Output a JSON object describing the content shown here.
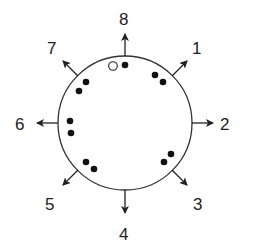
{
  "diagram": {
    "type": "circle-with-radial-arrows",
    "circle": {
      "cx": 125,
      "cy": 123,
      "r": 67,
      "stroke": "#333333"
    },
    "arrow_color": "#222222",
    "dot_color": "#111111",
    "directions": [
      {
        "label": "1",
        "angle_deg": 45
      },
      {
        "label": "2",
        "angle_deg": 0
      },
      {
        "label": "3",
        "angle_deg": -45
      },
      {
        "label": "4",
        "angle_deg": -90
      },
      {
        "label": "5",
        "angle_deg": -135
      },
      {
        "label": "6",
        "angle_deg": 180
      },
      {
        "label": "7",
        "angle_deg": 135
      },
      {
        "label": "8",
        "angle_deg": 90
      }
    ],
    "labels": {
      "d1": "1",
      "d2": "2",
      "d3": "3",
      "d4": "4",
      "d5": "5",
      "d6": "6",
      "d7": "7",
      "d8": "8"
    },
    "dots": [
      {
        "near": "8",
        "type": "open",
        "x": 113,
        "y": 66
      },
      {
        "near": "8",
        "type": "filled",
        "x": 125,
        "y": 65
      },
      {
        "near": "1",
        "type": "filled",
        "x": 155,
        "y": 75
      },
      {
        "near": "1",
        "type": "filled",
        "x": 163,
        "y": 82
      },
      {
        "near": "3",
        "type": "filled",
        "x": 171,
        "y": 154
      },
      {
        "near": "3",
        "type": "filled",
        "x": 164,
        "y": 162
      },
      {
        "near": "5",
        "type": "filled",
        "x": 86,
        "y": 162
      },
      {
        "near": "5",
        "type": "filled",
        "x": 94,
        "y": 169
      },
      {
        "near": "6",
        "type": "filled",
        "x": 70,
        "y": 121
      },
      {
        "near": "6",
        "type": "filled",
        "x": 71,
        "y": 133
      },
      {
        "near": "7",
        "type": "filled",
        "x": 86,
        "y": 82
      },
      {
        "near": "7",
        "type": "filled",
        "x": 79,
        "y": 91
      }
    ]
  }
}
